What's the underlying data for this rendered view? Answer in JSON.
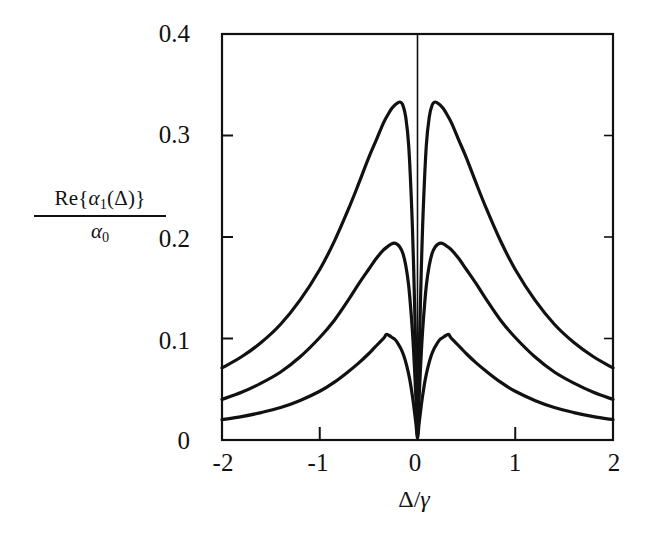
{
  "figure": {
    "background_color": "#ffffff",
    "line_color": "#111111",
    "axis_color": "#111111"
  },
  "axes": {
    "x": {
      "label_main": "Δ",
      "label_slash": "/",
      "label_denom": "γ",
      "label_full": "Δ/γ",
      "ticks": [
        "-2",
        "-1",
        "0",
        "1",
        "2"
      ],
      "range": [
        -2,
        2
      ]
    },
    "y": {
      "label_numerator_prefix": "Re{",
      "label_numerator_alpha": "α",
      "label_numerator_sub": "1",
      "label_numerator_suffix": "(Δ)}",
      "label_numerator_full": "Re{α₁(Δ)}",
      "label_denominator_alpha": "α",
      "label_denominator_sub": "0",
      "label_denominator_full": "α₀",
      "ticks": [
        "0",
        "0.1",
        "0.2",
        "0.3",
        "0.4"
      ],
      "range": [
        0,
        0.4
      ]
    }
  },
  "chart_data": {
    "type": "line",
    "title": "",
    "xlabel": "Δ/γ",
    "ylabel": "Re{α₁(Δ)}/α₀",
    "xlim": [
      -2,
      2
    ],
    "ylim": [
      0,
      0.4
    ],
    "xticks": [
      -2,
      -1,
      0,
      1,
      2
    ],
    "yticks": [
      0,
      0.1,
      0.2,
      0.3,
      0.4
    ],
    "grid": false,
    "legend": null,
    "annotations": [],
    "series": [
      {
        "name": "curve-upper",
        "peak_value": 0.333,
        "peak_positions": [
          -0.18,
          0.18
        ],
        "dip_value": 0.0,
        "dip_position": 0.0,
        "edge_value": 0.071,
        "x": [
          -2.0,
          -1.8,
          -1.6,
          -1.4,
          -1.2,
          -1.0,
          -0.85,
          -0.7,
          -0.6,
          -0.5,
          -0.42,
          -0.35,
          -0.3,
          -0.26,
          -0.22,
          -0.18,
          -0.15,
          -0.12,
          -0.09,
          -0.06,
          -0.04,
          -0.02,
          -0.01,
          0.0,
          0.01,
          0.02,
          0.04,
          0.06,
          0.09,
          0.12,
          0.15,
          0.18,
          0.22,
          0.26,
          0.3,
          0.35,
          0.42,
          0.5,
          0.6,
          0.7,
          0.85,
          1.0,
          1.2,
          1.4,
          1.6,
          1.8,
          2.0
        ],
        "y": [
          0.071,
          0.082,
          0.096,
          0.114,
          0.138,
          0.168,
          0.196,
          0.229,
          0.253,
          0.278,
          0.296,
          0.312,
          0.321,
          0.327,
          0.331,
          0.333,
          0.33,
          0.318,
          0.29,
          0.23,
          0.172,
          0.095,
          0.05,
          0.006,
          0.05,
          0.095,
          0.172,
          0.23,
          0.29,
          0.318,
          0.33,
          0.333,
          0.331,
          0.327,
          0.321,
          0.312,
          0.296,
          0.278,
          0.253,
          0.229,
          0.196,
          0.168,
          0.138,
          0.114,
          0.096,
          0.082,
          0.071
        ]
      },
      {
        "name": "curve-middle",
        "peak_value": 0.194,
        "peak_positions": [
          -0.24,
          0.24
        ],
        "dip_value": 0.0,
        "dip_position": 0.0,
        "edge_value": 0.04,
        "x": [
          -2.0,
          -1.8,
          -1.6,
          -1.4,
          -1.2,
          -1.0,
          -0.85,
          -0.7,
          -0.6,
          -0.5,
          -0.42,
          -0.35,
          -0.3,
          -0.27,
          -0.24,
          -0.21,
          -0.18,
          -0.15,
          -0.12,
          -0.09,
          -0.06,
          -0.04,
          -0.02,
          -0.01,
          0.0,
          0.01,
          0.02,
          0.04,
          0.06,
          0.09,
          0.12,
          0.15,
          0.18,
          0.21,
          0.24,
          0.27,
          0.3,
          0.35,
          0.42,
          0.5,
          0.6,
          0.7,
          0.85,
          1.0,
          1.2,
          1.4,
          1.6,
          1.8,
          2.0
        ],
        "y": [
          0.04,
          0.047,
          0.056,
          0.067,
          0.082,
          0.101,
          0.118,
          0.139,
          0.154,
          0.168,
          0.179,
          0.187,
          0.191,
          0.193,
          0.194,
          0.193,
          0.19,
          0.184,
          0.172,
          0.152,
          0.118,
          0.088,
          0.049,
          0.026,
          0.004,
          0.026,
          0.049,
          0.088,
          0.118,
          0.152,
          0.172,
          0.184,
          0.19,
          0.193,
          0.194,
          0.193,
          0.191,
          0.187,
          0.179,
          0.168,
          0.154,
          0.139,
          0.118,
          0.101,
          0.082,
          0.067,
          0.056,
          0.047,
          0.04
        ]
      },
      {
        "name": "curve-lower",
        "peak_value": 0.104,
        "peak_positions": [
          -0.32,
          0.32
        ],
        "dip_value": 0.0,
        "dip_position": 0.0,
        "edge_value": 0.02,
        "x": [
          -2.0,
          -1.8,
          -1.6,
          -1.4,
          -1.2,
          -1.0,
          -0.85,
          -0.7,
          -0.6,
          -0.5,
          -0.44,
          -0.38,
          -0.34,
          -0.32,
          -0.29,
          -0.26,
          -0.23,
          -0.2,
          -0.17,
          -0.14,
          -0.11,
          -0.08,
          -0.05,
          -0.03,
          -0.015,
          0.0,
          0.015,
          0.03,
          0.05,
          0.08,
          0.11,
          0.14,
          0.17,
          0.2,
          0.23,
          0.26,
          0.29,
          0.32,
          0.34,
          0.38,
          0.44,
          0.5,
          0.6,
          0.7,
          0.85,
          1.0,
          1.2,
          1.4,
          1.6,
          1.8,
          2.0
        ],
        "y": [
          0.02,
          0.023,
          0.027,
          0.032,
          0.039,
          0.048,
          0.057,
          0.068,
          0.076,
          0.085,
          0.091,
          0.097,
          0.101,
          0.104,
          0.103,
          0.101,
          0.099,
          0.095,
          0.09,
          0.083,
          0.073,
          0.06,
          0.042,
          0.027,
          0.015,
          0.002,
          0.015,
          0.027,
          0.042,
          0.06,
          0.073,
          0.083,
          0.09,
          0.095,
          0.099,
          0.101,
          0.103,
          0.104,
          0.101,
          0.097,
          0.091,
          0.085,
          0.076,
          0.068,
          0.057,
          0.048,
          0.039,
          0.032,
          0.027,
          0.023,
          0.02
        ]
      }
    ]
  }
}
